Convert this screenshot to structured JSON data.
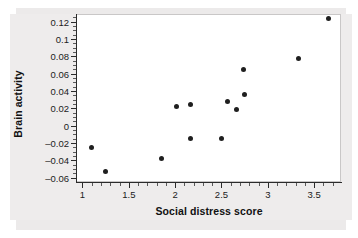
{
  "chart_data": {
    "type": "scatter",
    "title": "",
    "xlabel": "Social distress score",
    "ylabel": "Brain activity",
    "xlim": [
      0.93,
      3.79
    ],
    "ylim": [
      -0.065,
      0.129
    ],
    "grid": false,
    "legend": "none",
    "marker_color": "#1f1f1f",
    "xticks": [
      1,
      1.5,
      2,
      2.5,
      3,
      3.5
    ],
    "xticklabels": [
      "1",
      "1.5",
      "2",
      "2.5",
      "3",
      "3.5"
    ],
    "xminorticks": [
      1.1,
      1.2,
      1.3,
      1.4,
      1.6,
      1.7,
      1.8,
      1.9,
      2.1,
      2.2,
      2.3,
      2.4,
      2.6,
      2.7,
      2.8,
      2.9,
      3.1,
      3.2,
      3.3,
      3.4,
      3.6,
      3.7
    ],
    "yticks": [
      0.12,
      0.1,
      0.08,
      0.06,
      0.04,
      0.02,
      0,
      -0.02,
      -0.04,
      -0.06
    ],
    "yticklabels": [
      "0.12",
      "0.1",
      "0.08",
      "0.06",
      "0.04",
      "0.02",
      "0",
      "–0.02",
      "–0.04",
      "–0.06"
    ],
    "yminorticks": [
      0.125,
      0.115,
      0.11,
      0.105,
      0.095,
      0.09,
      0.085,
      0.075,
      0.07,
      0.065,
      0.055,
      0.05,
      0.045,
      0.035,
      0.03,
      0.025,
      0.015,
      0.01,
      0.005,
      -0.005,
      -0.01,
      -0.015,
      -0.025,
      -0.03,
      -0.035,
      -0.045,
      -0.05,
      -0.055
    ],
    "x": [
      1.1,
      1.25,
      1.85,
      2.02,
      2.17,
      2.17,
      2.5,
      2.57,
      2.66,
      2.74,
      2.75,
      3.33,
      3.65
    ],
    "y": [
      -0.025,
      -0.053,
      -0.038,
      0.022,
      0.025,
      -0.015,
      -0.015,
      0.028,
      0.019,
      0.065,
      0.036,
      0.078,
      0.124
    ],
    "points": [
      {
        "x": 1.1,
        "y": -0.025
      },
      {
        "x": 1.25,
        "y": -0.053
      },
      {
        "x": 1.85,
        "y": -0.038
      },
      {
        "x": 2.02,
        "y": 0.022
      },
      {
        "x": 2.17,
        "y": 0.025
      },
      {
        "x": 2.17,
        "y": -0.015
      },
      {
        "x": 2.5,
        "y": -0.015
      },
      {
        "x": 2.57,
        "y": 0.028
      },
      {
        "x": 2.66,
        "y": 0.019
      },
      {
        "x": 2.74,
        "y": 0.065
      },
      {
        "x": 2.75,
        "y": 0.036
      },
      {
        "x": 3.33,
        "y": 0.078
      },
      {
        "x": 3.65,
        "y": 0.124
      }
    ]
  }
}
